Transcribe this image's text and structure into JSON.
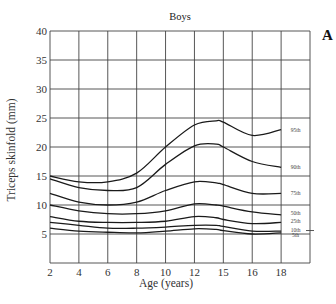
{
  "chart_data": {
    "type": "line",
    "title": "Boys",
    "panel_label": "A",
    "xlabel": "Age (years)",
    "ylabel": "Triceps skinfold (mm)",
    "x_tick_labels": [
      "2",
      "4",
      "6",
      "8",
      "10",
      "12",
      "15",
      "16",
      "18"
    ],
    "y_tick_labels": [
      "5",
      "10",
      "15",
      "20",
      "25",
      "30",
      "35",
      "40"
    ],
    "xlim": [
      2,
      20
    ],
    "ylim": [
      0,
      40
    ],
    "grid": true,
    "legend_position": "inline-right",
    "x": [
      2,
      4,
      6,
      8,
      10,
      12,
      13.5,
      14,
      16,
      18
    ],
    "series": [
      {
        "name": "95th",
        "values": [
          15,
          14,
          14,
          15.5,
          20,
          23.8,
          24.5,
          24.3,
          22,
          23
        ]
      },
      {
        "name": "90th",
        "values": [
          14.5,
          13,
          12.5,
          13,
          17,
          20.2,
          20.5,
          20,
          17.5,
          16.5
        ]
      },
      {
        "name": "75th",
        "values": [
          12,
          10.5,
          10,
          10.5,
          12.5,
          14,
          13.8,
          13.5,
          12,
          12
        ]
      },
      {
        "name": "50th",
        "values": [
          10,
          9,
          8.5,
          8.5,
          9,
          10.2,
          10,
          9.8,
          8.8,
          8.3
        ]
      },
      {
        "name": "25th",
        "values": [
          8,
          7.2,
          7,
          7,
          7.2,
          8,
          7.8,
          7.5,
          6.8,
          7
        ]
      },
      {
        "name": "10th",
        "values": [
          7,
          6.5,
          6,
          6,
          6.2,
          6.5,
          6.5,
          6.3,
          5.5,
          5.5
        ]
      },
      {
        "name": "5th",
        "values": [
          6,
          5.5,
          5.3,
          5.2,
          5.5,
          5.9,
          5.8,
          5.6,
          5,
          5.2
        ]
      }
    ],
    "series_label_y": {
      "95th": 23,
      "90th": 16.5,
      "75th": 12,
      "50th": 8.6,
      "25th": 7.2,
      "10th": 5.7,
      "5th": 4.8
    }
  }
}
